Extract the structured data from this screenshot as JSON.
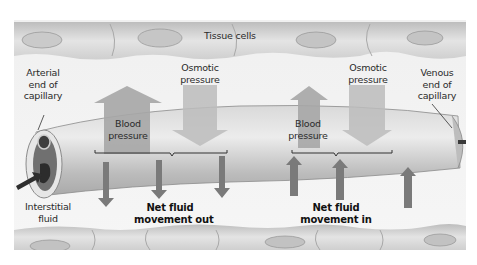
{
  "diagram": {
    "title_label": "Tissue cells",
    "arterial_end": [
      "Arterial",
      "end of",
      "capillary"
    ],
    "venous_end": [
      "Venous",
      "end of",
      "capillary"
    ],
    "interstitial": [
      "Interstitial",
      "fluid"
    ],
    "left": {
      "blood_pressure": [
        "Blood",
        "pressure"
      ],
      "osmotic_pressure": [
        "Osmotic",
        "pressure"
      ],
      "net_flow": [
        "Net fluid",
        "movement out"
      ]
    },
    "right": {
      "blood_pressure": [
        "Blood",
        "pressure"
      ],
      "osmotic_pressure": [
        "Osmotic",
        "pressure"
      ],
      "net_flow": [
        "Net fluid",
        "movement in"
      ]
    },
    "colors": {
      "background": "#f2f2f2",
      "cells": "#d6d6d6",
      "capillary": "#c8c8c8",
      "pressure_arrow": "#9a9a9a",
      "osmotic_box": "#bdbdbd",
      "flow_arrow": "#7a7a7a",
      "dark_arrow": "#303030"
    }
  }
}
